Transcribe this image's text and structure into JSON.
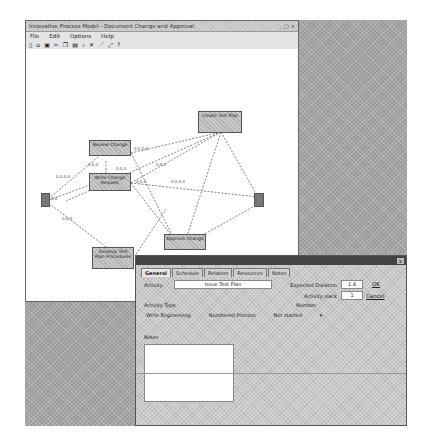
{
  "window": {
    "title": "Innovative Process Model - Document Change and Approval",
    "controls": [
      "minimize",
      "maximize",
      "close"
    ],
    "menu": [
      "File",
      "Edit",
      "Options",
      "Help"
    ],
    "toolbar_icons": [
      "new-icon",
      "open-icon",
      "save-icon",
      "cut-icon",
      "copy-icon",
      "paste-icon",
      "zoom-icon",
      "delete-icon",
      "pen-icon",
      "link-icon",
      "help-icon"
    ]
  },
  "diagram": {
    "nodes": [
      {
        "id": "start",
        "label": ""
      },
      {
        "id": "n1",
        "label": "Review Change"
      },
      {
        "id": "n2",
        "label": "Write Change Request"
      },
      {
        "id": "n3",
        "label": "Create Test Plan"
      },
      {
        "id": "n4",
        "label": "Develop Test Plan Procedures"
      },
      {
        "id": "n5",
        "label": "Approve Change"
      },
      {
        "id": "end",
        "label": ""
      }
    ],
    "edge_labels": [
      "0,0,0,0",
      "0,0,0",
      "0,0,0,0",
      "0,0,0",
      "0,0,0",
      "0,0,0",
      "0,0,0,0",
      "0,0,0",
      "0,0"
    ]
  },
  "dialog": {
    "close": "x",
    "tabs": [
      "General",
      "Schedule",
      "Relation",
      "Resources",
      "Notes"
    ],
    "activity_label": "Activity",
    "activity_value": "Issue Test Plan",
    "duration_label": "Expected Duration",
    "duration_value": "1.4",
    "slack_label": "Activity slack",
    "slack_value": "1",
    "type_label": "Activity Type",
    "number_label": "Number",
    "options": [
      "Write Engineering",
      "Numbered Process",
      "Not started"
    ],
    "notes_label": "Notes",
    "ok_label": "OK",
    "cancel_label": "Cancel"
  }
}
